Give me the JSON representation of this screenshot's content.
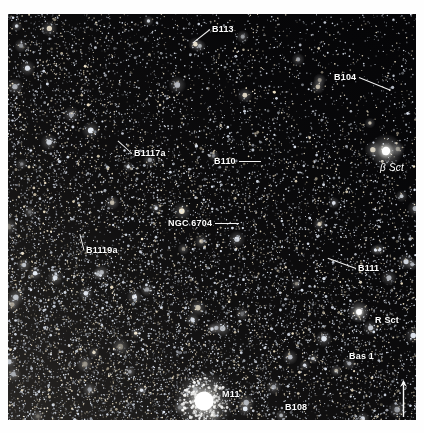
{
  "image": {
    "kind": "wide-field-astrophotograph",
    "subject": "Scutum star cloud",
    "background_color": "#050507",
    "border_color": "#ffffff",
    "label_color": "#ffffff",
    "leader_color": "#f2f2f2"
  },
  "annotations": [
    {
      "id": "b113",
      "label": "B113",
      "x": 204,
      "y": 10,
      "leader": {
        "len": 22,
        "angle": 142
      }
    },
    {
      "id": "b104",
      "label": "B104",
      "x": 326,
      "y": 58,
      "leader": {
        "len": 34,
        "angle": 22
      }
    },
    {
      "id": "b1117a",
      "label": "B1117a",
      "x": 126,
      "y": 134,
      "leader": {
        "len": 19,
        "angle": -138
      }
    },
    {
      "id": "b110",
      "label": "B110",
      "x": 206,
      "y": 142,
      "leader": {
        "len": 22,
        "angle": 0
      }
    },
    {
      "id": "beta-sct",
      "label": "β Sct",
      "x": 372,
      "y": 149,
      "leader": null,
      "greek": true
    },
    {
      "id": "ngc6704",
      "label": "NGC 6704",
      "x": 160,
      "y": 204,
      "leader": {
        "len": 24,
        "angle": 0
      }
    },
    {
      "id": "b1119a",
      "label": "B1119a",
      "x": 78,
      "y": 231,
      "leader": {
        "len": 17,
        "angle": -104
      }
    },
    {
      "id": "b111",
      "label": "B111",
      "x": 350,
      "y": 249,
      "leader": {
        "len": 30,
        "angle": -160
      }
    },
    {
      "id": "r-sct",
      "label": "R Sct",
      "x": 367,
      "y": 301,
      "leader": null
    },
    {
      "id": "bas1",
      "label": "Bas 1",
      "x": 341,
      "y": 337,
      "leader": null
    },
    {
      "id": "m11",
      "label": "M11",
      "x": 214,
      "y": 375,
      "leader": null
    },
    {
      "id": "b108",
      "label": "B108",
      "x": 277,
      "y": 388,
      "leader": null
    }
  ],
  "bright_objects": [
    {
      "id": "beta-sct-star",
      "name": "beta-scuti-star",
      "x": 378,
      "y": 137,
      "r": 4.2,
      "glow": 17
    },
    {
      "id": "r-sct-star",
      "name": "r-scuti-star",
      "x": 351,
      "y": 298,
      "r": 2.9,
      "glow": 11
    },
    {
      "id": "m11-cluster",
      "name": "m11-wild-duck-cluster",
      "x": 196,
      "y": 387,
      "r": 9.5,
      "glow": 30
    }
  ],
  "compass": {
    "name": "north-arrow",
    "x": 395,
    "y": 366,
    "length": 36,
    "direction": "up"
  }
}
